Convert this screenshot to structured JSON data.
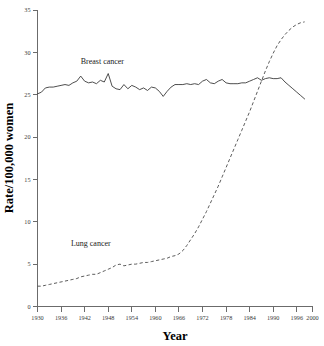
{
  "chart_data": {
    "type": "line",
    "title": "",
    "xlabel": "Year",
    "ylabel": "Rate/100,000 women",
    "xlim": [
      1930,
      2000
    ],
    "ylim": [
      0,
      35
    ],
    "grid": false,
    "legend_position": "inline-annotations",
    "xticks": [
      1930,
      1936,
      1942,
      1948,
      1954,
      1960,
      1966,
      1972,
      1978,
      1984,
      1990,
      1996,
      2000
    ],
    "xtick_labels": [
      "1930",
      "1936",
      "1942",
      "1948",
      "1954",
      "1960",
      "1966",
      "1972",
      "1978",
      "1984",
      "1990",
      "1996",
      "2000"
    ],
    "yticks": [
      0,
      5,
      10,
      15,
      20,
      25,
      30,
      35
    ],
    "ytick_labels": [
      "0",
      "5",
      "10",
      "15",
      "20",
      "25",
      "30",
      "35"
    ],
    "annotations": [
      {
        "text": "Breast cancer",
        "x": 1941,
        "y": 28.6
      },
      {
        "text": "Lung cancer",
        "x": 1938.5,
        "y": 7.2
      }
    ],
    "series": [
      {
        "name": "Breast cancer",
        "style": "solid",
        "color": "#3a3a3a",
        "x": [
          1930,
          1931,
          1932,
          1933,
          1934,
          1935,
          1936,
          1937,
          1938,
          1939,
          1940,
          1941,
          1942,
          1943,
          1944,
          1945,
          1946,
          1947,
          1948,
          1949,
          1950,
          1951,
          1952,
          1953,
          1954,
          1955,
          1956,
          1957,
          1958,
          1959,
          1960,
          1961,
          1962,
          1963,
          1964,
          1965,
          1966,
          1967,
          1968,
          1969,
          1970,
          1971,
          1972,
          1973,
          1974,
          1975,
          1976,
          1977,
          1978,
          1979,
          1980,
          1981,
          1982,
          1983,
          1984,
          1985,
          1986,
          1987,
          1988,
          1989,
          1990,
          1991,
          1992,
          1993,
          1994,
          1995,
          1996,
          1997,
          1998
        ],
        "values": [
          25.1,
          25.3,
          25.8,
          25.9,
          25.9,
          26.0,
          26.1,
          26.2,
          26.1,
          26.4,
          26.6,
          27.2,
          26.6,
          26.4,
          26.5,
          26.3,
          26.7,
          26.5,
          27.5,
          26.0,
          25.7,
          25.6,
          26.2,
          25.7,
          26.1,
          25.9,
          25.6,
          25.8,
          25.5,
          25.9,
          25.8,
          25.4,
          24.8,
          25.4,
          25.9,
          26.2,
          26.2,
          26.2,
          26.3,
          26.2,
          26.3,
          26.2,
          26.6,
          26.8,
          26.4,
          26.3,
          26.6,
          26.8,
          26.4,
          26.3,
          26.3,
          26.3,
          26.4,
          26.4,
          26.6,
          26.8,
          27.0,
          26.7,
          26.9,
          27.0,
          26.9,
          26.9,
          27.0,
          26.5,
          26.1,
          25.7,
          25.3,
          24.9,
          24.5
        ]
      },
      {
        "name": "Lung cancer",
        "style": "dashed",
        "color": "#4a4a4a",
        "x": [
          1930,
          1931,
          1932,
          1933,
          1934,
          1935,
          1936,
          1937,
          1938,
          1939,
          1940,
          1941,
          1942,
          1943,
          1944,
          1945,
          1946,
          1947,
          1948,
          1949,
          1950,
          1951,
          1952,
          1953,
          1954,
          1955,
          1956,
          1957,
          1958,
          1959,
          1960,
          1961,
          1962,
          1963,
          1964,
          1965,
          1966,
          1967,
          1968,
          1969,
          1970,
          1971,
          1972,
          1973,
          1974,
          1975,
          1976,
          1977,
          1978,
          1979,
          1980,
          1981,
          1982,
          1983,
          1984,
          1985,
          1986,
          1987,
          1988,
          1989,
          1990,
          1991,
          1992,
          1993,
          1994,
          1995,
          1996,
          1997,
          1998
        ],
        "values": [
          2.4,
          2.4,
          2.5,
          2.6,
          2.7,
          2.8,
          2.9,
          3.0,
          3.1,
          3.2,
          3.3,
          3.5,
          3.6,
          3.7,
          3.8,
          3.8,
          4.0,
          4.2,
          4.4,
          4.6,
          4.9,
          5.0,
          4.8,
          4.9,
          5.0,
          5.0,
          5.1,
          5.2,
          5.2,
          5.3,
          5.4,
          5.5,
          5.6,
          5.7,
          5.9,
          6.0,
          6.2,
          6.6,
          7.2,
          7.9,
          8.6,
          9.4,
          10.3,
          11.2,
          12.2,
          13.2,
          14.2,
          15.3,
          16.4,
          17.5,
          18.6,
          19.7,
          20.8,
          21.9,
          23.0,
          24.2,
          25.4,
          26.6,
          27.8,
          28.9,
          29.9,
          30.8,
          31.5,
          32.1,
          32.6,
          33.0,
          33.3,
          33.5,
          33.6
        ]
      }
    ]
  }
}
